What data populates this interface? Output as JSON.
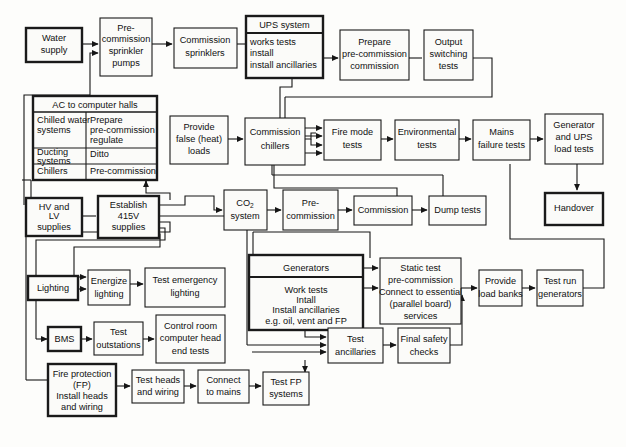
{
  "diagram": {
    "type": "flowchart",
    "background": "#fdfdfb",
    "line_color": "#161616",
    "box_fill": "#fbfbf9"
  },
  "nodes": {
    "water_supply": {
      "label": "Water\nsupply",
      "emphasis": "thick"
    },
    "precommission_sprinkler_pumps": {
      "label": "Pre-\ncommission\nsprinkler\npumps",
      "emphasis": "normal"
    },
    "commission_sprinklers": {
      "label": "Commission\nsprinklers",
      "emphasis": "normal"
    },
    "ups_system": {
      "header": "UPS system",
      "label": "works tests\ninstall\ninstall ancillaries",
      "emphasis": "thick"
    },
    "prepare_precommission_commission": {
      "label": "Prepare\npre-commission\ncommission",
      "emphasis": "normal"
    },
    "output_switching_tests": {
      "label": "Output\nswitching\ntests",
      "emphasis": "normal"
    },
    "ac_to_computer_halls": {
      "header": "AC to computer halls",
      "emphasis": "thick",
      "rows": [
        {
          "left": "Chilled water\nsystems",
          "right": "Prepare\npre-commission\nregulate"
        },
        {
          "left": "Ducting\nsystems",
          "right": "Ditto"
        },
        {
          "left": "Chillers",
          "right": "Pre-commission"
        }
      ]
    },
    "provide_false_heat_loads": {
      "label": "Provide\nfalse (heat)\nloads",
      "emphasis": "normal"
    },
    "commission_chillers": {
      "label": "Commission\nchillers",
      "emphasis": "normal"
    },
    "fire_mode_tests": {
      "label": "Fire mode\ntests",
      "emphasis": "normal"
    },
    "environmental_tests": {
      "label": "Environmental\ntests",
      "emphasis": "normal"
    },
    "mains_failure_tests": {
      "label": "Mains\nfailure tests",
      "emphasis": "normal"
    },
    "generator_and_ups_load_tests": {
      "label": "Generator\nand UPS\nload tests",
      "emphasis": "normal"
    },
    "handover": {
      "label": "Handover",
      "emphasis": "thick"
    },
    "hv_and_lv_supplies": {
      "label": "HV and\nLV\nsupplies",
      "emphasis": "thick"
    },
    "establish_415v_supplies": {
      "label": "Establish\n415V\nsupplies",
      "emphasis": "thick"
    },
    "co2_system": {
      "label": "CO2\nsystem",
      "label_main": "CO",
      "label_sub": "2",
      "label_line2": "system",
      "emphasis": "normal"
    },
    "precommission": {
      "label": "Pre-\ncommission",
      "emphasis": "normal"
    },
    "commission": {
      "label": "Commission",
      "emphasis": "normal"
    },
    "dump_tests": {
      "label": "Dump tests",
      "emphasis": "normal"
    },
    "lighting": {
      "label": "Lighting",
      "emphasis": "thick"
    },
    "energize_lighting": {
      "label": "Energize\nlighting",
      "emphasis": "normal"
    },
    "test_emergency_lighting": {
      "label": "Test emergency\nlighting",
      "emphasis": "normal"
    },
    "bms": {
      "label": "BMS",
      "emphasis": "thick"
    },
    "test_outstations": {
      "label": "Test\noutstations",
      "emphasis": "normal"
    },
    "control_room_head_end_tests": {
      "label": "Control room\ncomputer head\nend tests",
      "emphasis": "normal"
    },
    "fire_protection": {
      "label": "Fire protection\n(FP)\nInstall heads\nand wiring",
      "emphasis": "thick"
    },
    "test_heads_and_wiring": {
      "label": "Test heads\nand wiring",
      "emphasis": "normal"
    },
    "connect_to_mains": {
      "label": "Connect\nto mains",
      "emphasis": "normal"
    },
    "test_fp_systems": {
      "label": "Test FP\nsystems",
      "emphasis": "normal"
    },
    "generators": {
      "header": "Generators",
      "label": "Work tests\nIntall\nInstall ancillaries\ne.g. oil, vent and FP",
      "emphasis": "thick"
    },
    "static_test": {
      "label": "Static test\npre-commission\nConnect to essential\n(parallel board)\nservices",
      "emphasis": "normal"
    },
    "provide_load_banks": {
      "label": "Provide\nload banks",
      "emphasis": "normal"
    },
    "test_run_generators": {
      "label": "Test run\ngenerators",
      "emphasis": "normal"
    },
    "test_ancillaries": {
      "label": "Test\nancillaries",
      "emphasis": "normal"
    },
    "final_safety_checks": {
      "label": "Final safety\nchecks",
      "emphasis": "normal"
    }
  }
}
